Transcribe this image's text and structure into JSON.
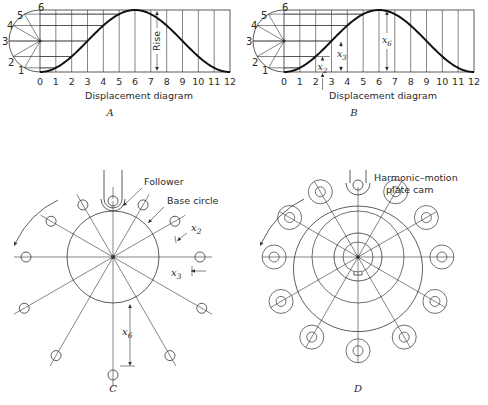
{
  "figure": {
    "panels": [
      {
        "id": "A",
        "caption": "A",
        "type": "displacement-diagram",
        "origin_x": 40,
        "width": 190,
        "top_y": 10,
        "bottom_y": 72,
        "xlabel": "Displacement diagram",
        "x_ticks": [
          "0",
          "1",
          "2",
          "3",
          "4",
          "5",
          "6",
          "7",
          "8",
          "9",
          "10",
          "11",
          "12"
        ],
        "circle_labels": [
          "1",
          "2",
          "3",
          "4",
          "5",
          "6"
        ],
        "annotations": {
          "rise_label": "Rise",
          "rise_x": 157
        }
      },
      {
        "id": "B",
        "caption": "B",
        "type": "displacement-diagram",
        "origin_x": 284,
        "width": 190,
        "top_y": 10,
        "bottom_y": 72,
        "xlabel": "Displacement diagram",
        "x_ticks": [
          "0",
          "1",
          "2",
          "3",
          "4",
          "5",
          "6",
          "7",
          "8",
          "9",
          "10",
          "11",
          "12"
        ],
        "circle_labels": [
          "1",
          "2",
          "3",
          "4",
          "5",
          "6"
        ],
        "annotations": {
          "x2_label": "x",
          "x2_sub": "2",
          "x3_label": "x",
          "x3_sub": "3",
          "x6_label": "x",
          "x6_sub": "6"
        }
      },
      {
        "id": "C",
        "caption": "C",
        "type": "cam-layout",
        "cx": 113,
        "cy": 257,
        "base_radius": 46,
        "labels": {
          "follower": "Follower",
          "base_circle": "Base circle",
          "x2": "x",
          "x2_sub": "2",
          "x3": "x",
          "x3_sub": "3",
          "x6": "x",
          "x6_sub": "6"
        }
      },
      {
        "id": "D",
        "caption": "D",
        "type": "cam-profile",
        "cx": 358,
        "cy": 257,
        "labels": {
          "title_line1": "Harmonic–motion",
          "title_line2": "plate cam"
        }
      }
    ]
  },
  "chart_data": {
    "type": "line",
    "title": "Displacement diagram",
    "xlabel": "Displacement diagram",
    "ylabel": "Rise",
    "x": [
      0,
      1,
      2,
      3,
      4,
      5,
      6,
      7,
      8,
      9,
      10,
      11,
      12
    ],
    "series": [
      {
        "name": "harmonic displacement (fraction of rise)",
        "values": [
          0,
          0.067,
          0.25,
          0.5,
          0.75,
          0.933,
          1,
          0.933,
          0.75,
          0.5,
          0.25,
          0.067,
          0
        ]
      }
    ],
    "ylim": [
      0,
      1
    ],
    "grid": true
  }
}
